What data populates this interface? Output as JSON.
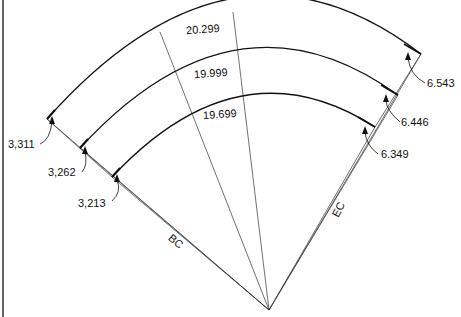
{
  "diagram": {
    "type": "curved road / bridge deck layout",
    "arcs": [
      {
        "name": "outer",
        "length_label": "20.299",
        "bc_offset": "3,311",
        "ec_offset": "6.543"
      },
      {
        "name": "middle",
        "length_label": "19.999",
        "bc_offset": "3,262",
        "ec_offset": "6.446"
      },
      {
        "name": "inner",
        "length_label": "19.699",
        "bc_offset": "3,213",
        "ec_offset": "6.349"
      }
    ],
    "line_labels": {
      "bc": "BC",
      "ec": "EC"
    }
  }
}
